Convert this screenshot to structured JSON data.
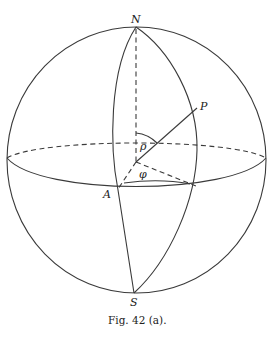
{
  "figure": {
    "caption": "Fig. 42 (a).",
    "labels": {
      "north": "N",
      "south": "S",
      "point_a": "A",
      "point_p": "P",
      "angle_rho": "ρ",
      "angle_phi": "φ"
    },
    "elements": [
      "sphere-outline",
      "equator-front",
      "equator-back",
      "polar-axis",
      "meridian-through-a",
      "meridian-through-p",
      "radius-to-p",
      "radius-to-a",
      "radius-to-meridian-p-equator",
      "angle-arc-rho",
      "angle-arc-phi"
    ]
  },
  "colors": {
    "line": "#3a3a3a",
    "text": "#222222",
    "background": "#ffffff"
  }
}
